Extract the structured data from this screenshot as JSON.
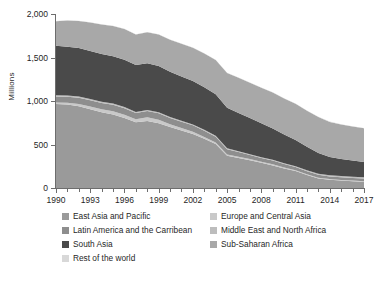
{
  "chart_data": {
    "type": "area",
    "stacked": true,
    "title": "",
    "xlabel": "",
    "ylabel": "Millions",
    "ylim": [
      0,
      2000
    ],
    "yticks": [
      0,
      500,
      1000,
      1500,
      2000
    ],
    "ytick_labels": [
      "0",
      "500",
      "1,000",
      "1,500",
      "2,000"
    ],
    "xlim": [
      1990,
      2017
    ],
    "xticks": [
      1990,
      1993,
      1996,
      1999,
      2002,
      2005,
      2008,
      2011,
      2014,
      2017
    ],
    "xtick_labels": [
      "1990",
      "1993",
      "1996",
      "1999",
      "2002",
      "2005",
      "2008",
      "2011",
      "2014",
      "2017"
    ],
    "minor_xticks_every": 1,
    "grid": false,
    "legend_position": "below",
    "x": [
      1990,
      1991,
      1992,
      1993,
      1994,
      1995,
      1996,
      1997,
      1998,
      1999,
      2000,
      2001,
      2002,
      2003,
      2004,
      2005,
      2006,
      2007,
      2008,
      2009,
      2010,
      2011,
      2012,
      2013,
      2014,
      2015,
      2016,
      2017
    ],
    "series": [
      {
        "name": "East Asia and Pacific",
        "color": "#9a9a9a",
        "values": [
          966,
          960,
          940,
          905,
          870,
          845,
          805,
          755,
          770,
          745,
          700,
          660,
          620,
          565,
          505,
          370,
          345,
          320,
          290,
          260,
          225,
          195,
          150,
          110,
          95,
          85,
          78,
          72
        ]
      },
      {
        "name": "Europe and Central Asia",
        "color": "#c9c9c9",
        "values": [
          18,
          20,
          26,
          32,
          36,
          38,
          38,
          36,
          42,
          40,
          34,
          30,
          26,
          22,
          19,
          16,
          14,
          12,
          11,
          12,
          11,
          10,
          9,
          9,
          8,
          8,
          7,
          7
        ]
      },
      {
        "name": "Latin America and the Carribean",
        "color": "#8e8e8e",
        "values": [
          68,
          70,
          72,
          72,
          72,
          74,
          74,
          70,
          72,
          74,
          72,
          72,
          74,
          72,
          66,
          60,
          54,
          48,
          44,
          44,
          40,
          36,
          34,
          32,
          30,
          30,
          30,
          30
        ]
      },
      {
        "name": "Middle East and North Africa",
        "color": "#bdbdbd",
        "values": [
          14,
          14,
          14,
          14,
          13,
          13,
          13,
          12,
          12,
          12,
          11,
          11,
          11,
          10,
          10,
          10,
          9,
          9,
          9,
          9,
          9,
          10,
          11,
          12,
          13,
          14,
          15,
          16
        ]
      },
      {
        "name": "South Asia",
        "color": "#4a4a4a",
        "values": [
          568,
          560,
          556,
          552,
          548,
          545,
          545,
          540,
          538,
          530,
          520,
          510,
          500,
          490,
          478,
          465,
          440,
          415,
          390,
          360,
          330,
          300,
          270,
          240,
          210,
          195,
          185,
          175
        ]
      },
      {
        "name": "Sub-Saharan Africa",
        "color": "#a8a8a8",
        "values": [
          283,
          300,
          312,
          326,
          340,
          348,
          352,
          352,
          356,
          362,
          368,
          374,
          382,
          388,
          394,
          400,
          404,
          406,
          408,
          412,
          414,
          416,
          414,
          412,
          404,
          398,
          392,
          386
        ]
      },
      {
        "name": "Rest of the world",
        "color": "#d8d8d8",
        "values": [
          3,
          3,
          3,
          3,
          3,
          3,
          3,
          3,
          3,
          3,
          3,
          3,
          3,
          3,
          3,
          3,
          3,
          3,
          3,
          3,
          3,
          3,
          3,
          3,
          3,
          3,
          3,
          3
        ]
      }
    ],
    "totals": [
      1920,
      1927,
      1923,
      1904,
      1882,
      1866,
      1830,
      1768,
      1793,
      1766,
      1708,
      1660,
      1616,
      1550,
      1475,
      1324,
      1269,
      1213,
      1155,
      1100,
      1032,
      970,
      891,
      818,
      763,
      733,
      710,
      689
    ]
  },
  "legend": {
    "column_left": [
      {
        "label": "East Asia and Pacific",
        "color": "#9a9a9a"
      },
      {
        "label": "Latin America and the Carribean",
        "color": "#8e8e8e"
      },
      {
        "label": "South Asia",
        "color": "#4a4a4a"
      },
      {
        "label": "Rest of the world",
        "color": "#d8d8d8"
      }
    ],
    "column_right": [
      {
        "label": "Europe and Central Asia",
        "color": "#c9c9c9"
      },
      {
        "label": "Middle East and North Africa",
        "color": "#bdbdbd"
      },
      {
        "label": "Sub-Saharan Africa",
        "color": "#a8a8a8"
      }
    ]
  }
}
